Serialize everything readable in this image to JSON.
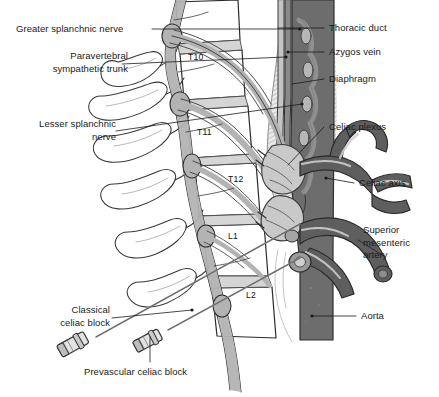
{
  "figure": {
    "palette": {
      "background": "#ffffff",
      "outline": "#2b2b2b",
      "aorta_dark": "#6d6d6d",
      "vessel_dark": "#5e5e5e",
      "nerve_gray": "#b3b3b3",
      "nerve_light": "#c9c9c9",
      "diaphragm_gray": "#cfcfcf",
      "muscle_gray": "#8f8f8f",
      "bone_white": "#ffffff",
      "leader_line": "#1a1a1a",
      "needle_gray": "#9a9a9a",
      "text": "#1a1a1a"
    }
  },
  "labels_left": [
    {
      "id": "greater-splanchnic-nerve",
      "text": "Greater splanchnic nerve",
      "x": 18,
      "y": 24,
      "align": "left"
    },
    {
      "id": "paravertebral-sympathetic-trunk",
      "text": "Paravertebral\nsympathetic trunk",
      "x": 12,
      "y": 52,
      "align": "left"
    },
    {
      "id": "lesser-splanchnic-nerve",
      "text": "Lesser splanchnic\nnerve",
      "x": 18,
      "y": 119,
      "align": "left"
    },
    {
      "id": "classical-celiac-block",
      "text": "Classical\nceliac block",
      "x": 44,
      "y": 305,
      "align": "left"
    }
  ],
  "labels_right": [
    {
      "id": "thoracic-duct",
      "text": "Thoracic duct",
      "x": 329,
      "y": 23
    },
    {
      "id": "azygos-vein",
      "text": "Azygos vein",
      "x": 329,
      "y": 47
    },
    {
      "id": "diaphragm",
      "text": "Diaphragm",
      "x": 329,
      "y": 74
    },
    {
      "id": "celiac-plexus",
      "text": "Celiac plexus",
      "x": 329,
      "y": 121
    },
    {
      "id": "celiac-axis",
      "text": "Celiac axis",
      "x": 359,
      "y": 178
    },
    {
      "id": "superior-mesenteric-artery",
      "text": "Superior\nmesenteric\nartery",
      "x": 363,
      "y": 225
    },
    {
      "id": "aorta",
      "text": "Aorta",
      "x": 361,
      "y": 311
    }
  ],
  "labels_bottom": [
    {
      "id": "prevascular-celiac-block",
      "text": "Prevascular celiac block",
      "x": 84,
      "y": 367
    }
  ],
  "vertebrae": [
    {
      "id": "t10",
      "text": "T10",
      "x": 188,
      "y": 52
    },
    {
      "id": "t11",
      "text": "T11",
      "x": 197,
      "y": 127
    },
    {
      "id": "t12",
      "text": "T12",
      "x": 228,
      "y": 174
    },
    {
      "id": "l1",
      "text": "L1",
      "x": 228,
      "y": 231
    },
    {
      "id": "l2",
      "text": "L2",
      "x": 246,
      "y": 290
    }
  ]
}
